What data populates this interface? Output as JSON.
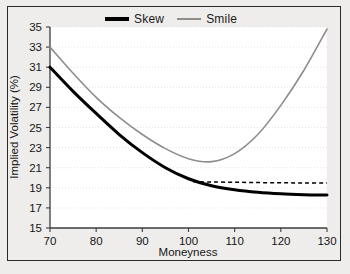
{
  "legend": {
    "entries": [
      {
        "label": "Skew",
        "color": "#000000",
        "style": "solid-thick"
      },
      {
        "label": "Smile",
        "color": "#8d8d8d",
        "style": "solid-thin"
      }
    ]
  },
  "chart_data": {
    "type": "line",
    "title": "",
    "xlabel": "Moneyness",
    "ylabel": "Implied Volatility (%)",
    "xlim": [
      70,
      130
    ],
    "ylim": [
      15,
      35
    ],
    "xticks": [
      70,
      80,
      90,
      100,
      110,
      120,
      130
    ],
    "yticks": [
      15,
      17,
      19,
      21,
      23,
      25,
      27,
      29,
      31,
      33,
      35
    ],
    "grid": true,
    "grid_axis": "y",
    "legend_position": "top-center",
    "x": [
      70,
      75,
      80,
      85,
      90,
      95,
      100,
      105,
      110,
      115,
      120,
      125,
      130
    ],
    "series": [
      {
        "name": "Skew",
        "color": "#000000",
        "style": "solid",
        "width": 3,
        "values": [
          31.0,
          28.6,
          26.4,
          24.3,
          22.5,
          21.0,
          19.9,
          19.2,
          18.8,
          18.55,
          18.4,
          18.32,
          18.28
        ]
      },
      {
        "name": "Smile",
        "color": "#8d8d8d",
        "style": "solid",
        "width": 1.6,
        "values": [
          33.0,
          30.4,
          28.0,
          26.0,
          24.3,
          22.9,
          21.9,
          21.6,
          22.4,
          24.3,
          27.2,
          30.7,
          34.8
        ]
      },
      {
        "name": "Skew extrapolation",
        "color": "#000000",
        "style": "dashed",
        "width": 1.5,
        "x": [
          101,
          105,
          110,
          115,
          120,
          125,
          130
        ],
        "values": [
          19.6,
          19.58,
          19.55,
          19.52,
          19.5,
          19.48,
          19.47
        ]
      }
    ]
  }
}
